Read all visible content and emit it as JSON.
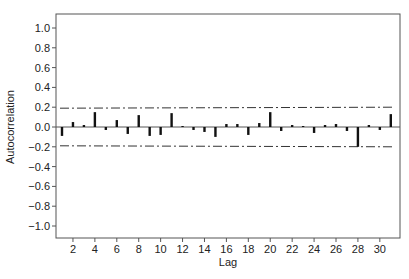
{
  "chart_data": {
    "type": "bar",
    "title": "",
    "xlabel": "Lag",
    "ylabel": "Autocorrelation",
    "ylim": [
      -1.1,
      1.1
    ],
    "xlim": [
      0.5,
      31.5
    ],
    "grid": false,
    "legend": null,
    "yticks": [
      -1.0,
      -0.8,
      -0.6,
      -0.4,
      -0.2,
      0.0,
      0.2,
      0.4,
      0.6,
      0.8,
      1.0
    ],
    "ytick_labels": [
      "−1.0",
      "−0.8",
      "−0.6",
      "−0.4",
      "−0.2",
      "0.0",
      "0.2",
      "0.4",
      "0.6",
      "0.8",
      "1.0"
    ],
    "xticks": [
      2,
      4,
      6,
      8,
      10,
      12,
      14,
      16,
      18,
      20,
      22,
      24,
      26,
      28,
      30
    ],
    "lags": [
      1,
      2,
      3,
      4,
      5,
      6,
      7,
      8,
      9,
      10,
      11,
      12,
      13,
      14,
      15,
      16,
      17,
      18,
      19,
      20,
      21,
      22,
      23,
      24,
      25,
      26,
      27,
      28,
      29,
      30,
      31
    ],
    "values": [
      -0.09,
      0.05,
      0.02,
      0.15,
      -0.03,
      0.07,
      -0.07,
      0.12,
      -0.09,
      -0.08,
      0.14,
      0.01,
      -0.03,
      -0.05,
      -0.1,
      0.03,
      0.03,
      -0.08,
      0.04,
      0.15,
      -0.04,
      0.02,
      0.01,
      -0.06,
      0.02,
      0.03,
      -0.04,
      -0.2,
      0.02,
      -0.03,
      0.13
    ],
    "confidence_band": {
      "upper_start": 0.19,
      "upper_end": 0.2,
      "lower_start": -0.19,
      "lower_end": -0.2,
      "style": "dash-dot"
    },
    "annotations": []
  },
  "caption": {
    "text": ""
  },
  "colors": {
    "bar": "#111111",
    "axis": "#555555",
    "band": "#333333",
    "zero_line": "#555555"
  }
}
